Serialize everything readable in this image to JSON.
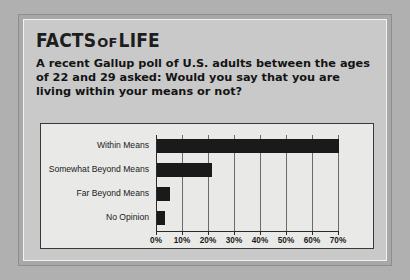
{
  "headline": {
    "part1": "FACTS",
    "part2": "OF",
    "part3": "LIFE"
  },
  "question": "A recent Gallup poll of U.S. adults between the ages of 22 and 29 asked: Would you say that you are living within your means or not?",
  "chart_data": {
    "type": "bar",
    "orientation": "horizontal",
    "title": "",
    "xlabel": "",
    "ylabel": "",
    "categories": [
      "Within Means",
      "Somewhat Beyond Means",
      "Far Beyond Means",
      "No Opinion"
    ],
    "values": [
      70,
      21,
      5,
      3
    ],
    "tick_labels": [
      "0%",
      "10%",
      "20%",
      "30%",
      "40%",
      "50%",
      "60%",
      "70%"
    ],
    "tick_values": [
      0,
      10,
      20,
      30,
      40,
      50,
      60,
      70
    ],
    "xlim": [
      0,
      70
    ],
    "grid": true,
    "legend": "none",
    "bar_color": "#1a1a1a"
  },
  "colors": {
    "page_background": "#b0b0b0",
    "card_background": "#c9c9c9",
    "chart_background": "#e9e9e7",
    "text": "#141414"
  }
}
